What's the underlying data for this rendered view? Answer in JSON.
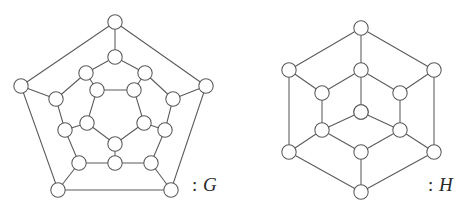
{
  "figure": {
    "background_color": "#ffffff",
    "stroke_color": "#5a5a5a",
    "node_fill_color": "#ffffff",
    "label_color": "#2b2b2b",
    "node_radius": 7.2,
    "edge_width": 1.05
  },
  "graphs": [
    {
      "id": "G",
      "name": "graph-g",
      "label_text": ": G",
      "label_separator": ":",
      "label_name": "G",
      "vertex_count": 20,
      "edge_count": 30,
      "description": "Desargues graph drawn as four concentric pentagonal rings",
      "vertices": [
        {
          "id": 0,
          "ring": "outer",
          "x": 115,
          "y": 22
        },
        {
          "id": 1,
          "ring": "outer",
          "x": 206,
          "y": 86
        },
        {
          "id": 2,
          "ring": "outer",
          "x": 171,
          "y": 190
        },
        {
          "id": 3,
          "ring": "outer",
          "x": 58,
          "y": 190
        },
        {
          "id": 4,
          "ring": "outer",
          "x": 21,
          "y": 86
        },
        {
          "id": 5,
          "ring": "mid-outer",
          "x": 115,
          "y": 57
        },
        {
          "id": 6,
          "ring": "mid-outer",
          "x": 173,
          "y": 99
        },
        {
          "id": 7,
          "ring": "mid-outer",
          "x": 151,
          "y": 163
        },
        {
          "id": 8,
          "ring": "mid-outer",
          "x": 79,
          "y": 163
        },
        {
          "id": 9,
          "ring": "mid-outer",
          "x": 56,
          "y": 99
        },
        {
          "id": 10,
          "ring": "mid-inner",
          "x": 86,
          "y": 73
        },
        {
          "id": 11,
          "ring": "mid-inner",
          "x": 145,
          "y": 73
        },
        {
          "id": 12,
          "ring": "mid-inner",
          "x": 165,
          "y": 130
        },
        {
          "id": 13,
          "ring": "mid-inner",
          "x": 115,
          "y": 163
        },
        {
          "id": 14,
          "ring": "mid-inner",
          "x": 65,
          "y": 130
        },
        {
          "id": 15,
          "ring": "inner",
          "x": 97,
          "y": 90
        },
        {
          "id": 16,
          "ring": "inner",
          "x": 134,
          "y": 90
        },
        {
          "id": 17,
          "ring": "inner",
          "x": 144,
          "y": 123
        },
        {
          "id": 18,
          "ring": "inner",
          "x": 115,
          "y": 144
        },
        {
          "id": 19,
          "ring": "inner",
          "x": 87,
          "y": 123
        }
      ],
      "edges": [
        [
          0,
          1
        ],
        [
          1,
          2
        ],
        [
          2,
          3
        ],
        [
          3,
          4
        ],
        [
          4,
          0
        ],
        [
          0,
          5
        ],
        [
          1,
          6
        ],
        [
          2,
          7
        ],
        [
          3,
          8
        ],
        [
          4,
          9
        ],
        [
          5,
          10
        ],
        [
          5,
          11
        ],
        [
          6,
          11
        ],
        [
          6,
          12
        ],
        [
          7,
          12
        ],
        [
          7,
          13
        ],
        [
          8,
          13
        ],
        [
          8,
          14
        ],
        [
          9,
          14
        ],
        [
          9,
          10
        ],
        [
          10,
          15
        ],
        [
          11,
          16
        ],
        [
          12,
          17
        ],
        [
          13,
          18
        ],
        [
          14,
          19
        ],
        [
          15,
          16
        ],
        [
          16,
          17
        ],
        [
          17,
          18
        ],
        [
          18,
          19
        ],
        [
          19,
          15
        ]
      ]
    },
    {
      "id": "H",
      "name": "graph-h",
      "label_text": ": H",
      "label_separator": ":",
      "label_name": "H",
      "vertex_count": 14,
      "edge_count": 21,
      "description": "Hexagonal graph drawn as an outer hexagon, an inner hexagon and two central vertices",
      "vertices": [
        {
          "id": 0,
          "ring": "outer",
          "x": 116,
          "y": 28
        },
        {
          "id": 1,
          "ring": "outer",
          "x": 189,
          "y": 70
        },
        {
          "id": 2,
          "ring": "outer",
          "x": 189,
          "y": 152
        },
        {
          "id": 3,
          "ring": "outer",
          "x": 116,
          "y": 192
        },
        {
          "id": 4,
          "ring": "outer",
          "x": 44,
          "y": 152
        },
        {
          "id": 5,
          "ring": "outer",
          "x": 44,
          "y": 70
        },
        {
          "id": 6,
          "ring": "inner",
          "x": 116,
          "y": 70
        },
        {
          "id": 7,
          "ring": "inner",
          "x": 155,
          "y": 93
        },
        {
          "id": 8,
          "ring": "inner",
          "x": 155,
          "y": 130
        },
        {
          "id": 9,
          "ring": "inner",
          "x": 116,
          "y": 152
        },
        {
          "id": 10,
          "ring": "inner",
          "x": 77,
          "y": 130
        },
        {
          "id": 11,
          "ring": "inner",
          "x": 77,
          "y": 93
        },
        {
          "id": 12,
          "ring": "center",
          "x": 116,
          "y": 112
        },
        {
          "id": 13,
          "ring": "center",
          "x": 116,
          "y": 112
        }
      ],
      "edges": [
        [
          0,
          1
        ],
        [
          1,
          2
        ],
        [
          2,
          3
        ],
        [
          3,
          4
        ],
        [
          4,
          5
        ],
        [
          5,
          0
        ],
        [
          0,
          6
        ],
        [
          1,
          7
        ],
        [
          2,
          8
        ],
        [
          3,
          9
        ],
        [
          4,
          10
        ],
        [
          5,
          11
        ],
        [
          6,
          7
        ],
        [
          7,
          8
        ],
        [
          8,
          9
        ],
        [
          9,
          10
        ],
        [
          10,
          11
        ],
        [
          11,
          6
        ],
        [
          6,
          12
        ],
        [
          8,
          12
        ],
        [
          10,
          12
        ]
      ]
    }
  ]
}
